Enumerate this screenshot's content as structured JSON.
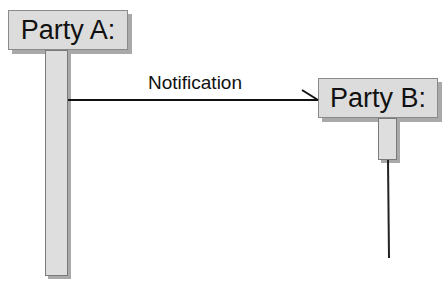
{
  "diagram": {
    "type": "sequence",
    "participants": [
      {
        "id": "A",
        "label": "Party A:"
      },
      {
        "id": "B",
        "label": "Party B:"
      }
    ],
    "messages": [
      {
        "from": "A",
        "to": "B",
        "label": "Notification",
        "arrow": "open"
      }
    ]
  },
  "colors": {
    "box_fill": "#dcdcdc",
    "shadow": "#a9a9a9",
    "line": "#111111"
  }
}
